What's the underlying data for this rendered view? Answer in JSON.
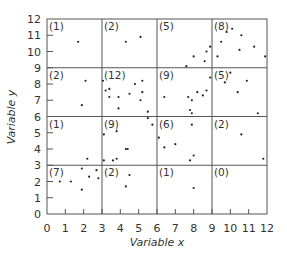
{
  "chart_data": {
    "type": "scatter",
    "title": "",
    "xlabel": "Variable x",
    "ylabel": "Variable y",
    "xlim": [
      0,
      12
    ],
    "ylim": [
      0,
      12
    ],
    "xticks": [
      0,
      1,
      2,
      3,
      4,
      5,
      6,
      7,
      8,
      9,
      10,
      11,
      12
    ],
    "yticks": [
      0,
      1,
      2,
      3,
      4,
      5,
      6,
      7,
      8,
      9,
      10,
      11,
      12
    ],
    "grid": {
      "x_lines": [
        3,
        6,
        9
      ],
      "y_lines": [
        3,
        6,
        9
      ]
    },
    "quadrat_counts": [
      {
        "col": 0,
        "row": 3,
        "label": "(1)"
      },
      {
        "col": 1,
        "row": 3,
        "label": "(2)"
      },
      {
        "col": 2,
        "row": 3,
        "label": "(5)"
      },
      {
        "col": 3,
        "row": 3,
        "label": "(8)"
      },
      {
        "col": 0,
        "row": 2,
        "label": "(2)"
      },
      {
        "col": 1,
        "row": 2,
        "label": "(12)"
      },
      {
        "col": 2,
        "row": 2,
        "label": "(9)"
      },
      {
        "col": 3,
        "row": 2,
        "label": "(5)"
      },
      {
        "col": 0,
        "row": 1,
        "label": "(1)"
      },
      {
        "col": 1,
        "row": 1,
        "label": "(9)"
      },
      {
        "col": 2,
        "row": 1,
        "label": "(6)"
      },
      {
        "col": 3,
        "row": 1,
        "label": "(2)"
      },
      {
        "col": 0,
        "row": 0,
        "label": "(7)"
      },
      {
        "col": 1,
        "row": 0,
        "label": "(2)"
      },
      {
        "col": 2,
        "row": 0,
        "label": "(1)"
      },
      {
        "col": 3,
        "row": 0,
        "label": "(0)"
      }
    ],
    "points": [
      [
        1.7,
        10.6
      ],
      [
        4.3,
        10.6
      ],
      [
        5.1,
        10.9
      ],
      [
        7.6,
        9.1
      ],
      [
        8.0,
        9.7
      ],
      [
        8.6,
        9.4
      ],
      [
        8.7,
        10.0
      ],
      [
        8.9,
        10.3
      ],
      [
        9.3,
        9.7
      ],
      [
        9.5,
        10.6
      ],
      [
        9.8,
        11.2
      ],
      [
        10.1,
        11.4
      ],
      [
        10.6,
        11.0
      ],
      [
        10.5,
        10.1
      ],
      [
        11.3,
        10.3
      ],
      [
        11.9,
        9.7
      ],
      [
        2.1,
        8.2
      ],
      [
        1.9,
        6.7
      ],
      [
        3.05,
        8.2
      ],
      [
        3.2,
        7.6
      ],
      [
        3.4,
        7.7
      ],
      [
        3.4,
        7.2
      ],
      [
        3.9,
        7.2
      ],
      [
        3.9,
        6.5
      ],
      [
        4.5,
        7.4
      ],
      [
        4.8,
        8.0
      ],
      [
        5.2,
        8.2
      ],
      [
        5.2,
        7.5
      ],
      [
        5.1,
        7.0
      ],
      [
        5.5,
        6.3
      ],
      [
        6.4,
        7.2
      ],
      [
        7.7,
        7.2
      ],
      [
        7.9,
        7.0
      ],
      [
        8.2,
        7.5
      ],
      [
        8.5,
        7.3
      ],
      [
        8.7,
        7.6
      ],
      [
        8.9,
        8.4
      ],
      [
        7.8,
        6.4
      ],
      [
        7.9,
        6.2
      ],
      [
        10.0,
        8.7
      ],
      [
        9.7,
        8.1
      ],
      [
        10.9,
        8.2
      ],
      [
        10.4,
        7.5
      ],
      [
        11.5,
        6.2
      ],
      [
        2.2,
        3.4
      ],
      [
        3.1,
        4.9
      ],
      [
        3.8,
        5.1
      ],
      [
        4.3,
        4.0
      ],
      [
        4.4,
        4.0
      ],
      [
        3.1,
        3.3
      ],
      [
        3.6,
        3.3
      ],
      [
        3.8,
        3.4
      ],
      [
        5.5,
        5.9
      ],
      [
        5.75,
        5.5
      ],
      [
        6.1,
        4.7
      ],
      [
        6.4,
        4.1
      ],
      [
        7.0,
        4.3
      ],
      [
        7.9,
        5.5
      ],
      [
        8.0,
        3.6
      ],
      [
        7.8,
        3.3
      ],
      [
        10.6,
        4.9
      ],
      [
        11.8,
        3.4
      ],
      [
        0.7,
        2.0
      ],
      [
        1.3,
        2.0
      ],
      [
        1.9,
        2.8
      ],
      [
        1.9,
        1.5
      ],
      [
        2.3,
        2.3
      ],
      [
        2.7,
        2.7
      ],
      [
        2.8,
        2.2
      ],
      [
        4.5,
        2.4
      ],
      [
        4.3,
        1.7
      ],
      [
        8.0,
        1.6
      ]
    ],
    "colors": {
      "axis": "#555555",
      "points": "#222222",
      "text": "#333333"
    }
  }
}
